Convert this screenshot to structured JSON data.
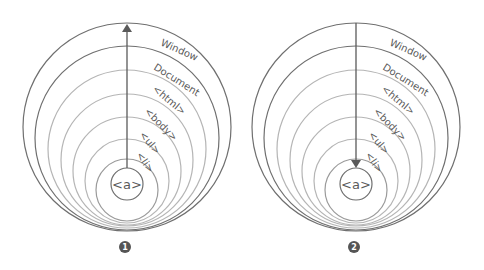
{
  "diagrams": [
    {
      "number": "1",
      "direction": "up",
      "caption": "Event bubbling",
      "layers": [
        "Window",
        "Document",
        "<html>",
        "<body>",
        "<ul>",
        "<li>"
      ],
      "target": "<a>"
    },
    {
      "number": "2",
      "direction": "down",
      "caption": "Event capturing",
      "layers": [
        "Window",
        "Document",
        "<html>",
        "<body>",
        "<ul>",
        "<li>"
      ],
      "target": "<a>"
    }
  ],
  "colors": {
    "outer_stroke": "#6f6f6f",
    "inner_stroke": "#b5b5b5",
    "arrow": "#5a5a5a",
    "label": "#5a5a5a",
    "badge": "#555555"
  }
}
